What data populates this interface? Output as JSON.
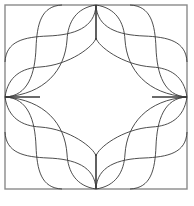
{
  "figure": {
    "colors": {
      "background": "#ffffff",
      "frame": "#8a8a8a",
      "lines": "#3a3a3a"
    },
    "frame": {
      "x": 5,
      "y": 5,
      "width": 182,
      "height": 184
    },
    "center": {
      "x": 96,
      "y": 97
    },
    "symmetry": "4-fold mirror (horizontal and vertical)",
    "quadrant_paths": [
      {
        "name": "v1",
        "d": "M62,5 C41,6 37,24 36,48 C35,74 28,96 5,97"
      },
      {
        "name": "v2",
        "d": "M96,5 C76,8 68,22 67,40 C65,70 45,94 5,97"
      },
      {
        "name": "h1",
        "d": "M5,62 C6,41 24,37 48,36 C74,35 95,28 96,5"
      },
      {
        "name": "h2",
        "d": "M5,97 C8,76 22,68 40,67 C70,65 94,46 96,38"
      }
    ],
    "stubs": [
      {
        "name": "top-stub",
        "d": "M96,5 L96,40"
      },
      {
        "name": "left-stub",
        "d": "M5,97 L40,97"
      }
    ]
  }
}
